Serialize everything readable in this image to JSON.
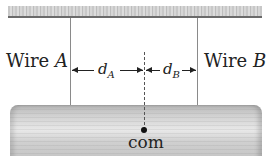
{
  "diagram": {
    "wire_a": {
      "label": "Wire ",
      "letter": "A"
    },
    "wire_b": {
      "label": "Wire ",
      "letter": "B"
    },
    "distance_a": {
      "symbol": "d",
      "subscript": "A"
    },
    "distance_b": {
      "symbol": "d",
      "subscript": "B"
    },
    "center_of_mass": {
      "label": "com"
    }
  }
}
